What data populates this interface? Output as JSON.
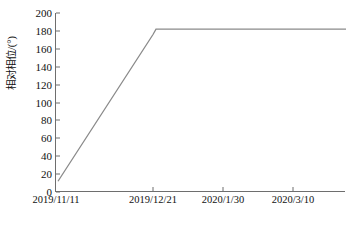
{
  "chart_data": {
    "type": "line",
    "title": "",
    "xlabel": "",
    "ylabel": "相对相位/(°)",
    "ylim": [
      0,
      200
    ],
    "yticks": [
      0,
      20,
      40,
      60,
      80,
      100,
      120,
      140,
      160,
      180,
      200
    ],
    "ytick_labels": [
      "0",
      "20",
      "40",
      "60",
      "80",
      "100",
      "120",
      "140",
      "160",
      "180",
      "200"
    ],
    "xtick_labels": [
      "2019/11/11",
      "2019/12/21",
      "2020/1/30",
      "2020/3/10"
    ],
    "xtick_positions": [
      0,
      0.3345,
      0.5758,
      0.8172
    ],
    "grid": false,
    "legend": false,
    "series": [
      {
        "name": "相对相位",
        "color": "#8a8a8a",
        "x": [
          0.0069,
          0.3345,
          0.3448,
          1.0
        ],
        "values": [
          12,
          176,
          182,
          182
        ]
      }
    ],
    "annotations": []
  }
}
